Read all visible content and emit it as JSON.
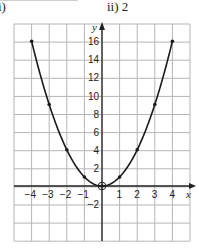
{
  "header": {
    "left_label": "i)",
    "right_label": "ii)  2"
  },
  "chart_data": {
    "type": "line",
    "title": "",
    "xlabel": "x",
    "ylabel": "y",
    "function": "y = x^2",
    "x": [
      -4,
      -3,
      -2,
      -1,
      0,
      1,
      2,
      3,
      4
    ],
    "series": [
      {
        "name": "y = x^2",
        "values": [
          16,
          9,
          4,
          1,
          0,
          1,
          4,
          9,
          16
        ]
      }
    ],
    "highlighted_point": {
      "x": 0,
      "y": 0,
      "style": "circled"
    },
    "xlim": [
      -5,
      5
    ],
    "ylim": [
      -6,
      18
    ],
    "x_ticks": [
      "-4",
      "-3",
      "-2",
      "-1",
      "1",
      "2",
      "3",
      "4"
    ],
    "y_ticks": [
      "16",
      "14",
      "12",
      "10",
      "8",
      "6",
      "4",
      "2",
      "-2"
    ],
    "grid": true,
    "grid_step": {
      "x": 1,
      "y": 2
    },
    "legend": null
  },
  "colors": {
    "grid": "#b5b5b5",
    "axis": "#222222",
    "curve": "#1a1a1a"
  }
}
